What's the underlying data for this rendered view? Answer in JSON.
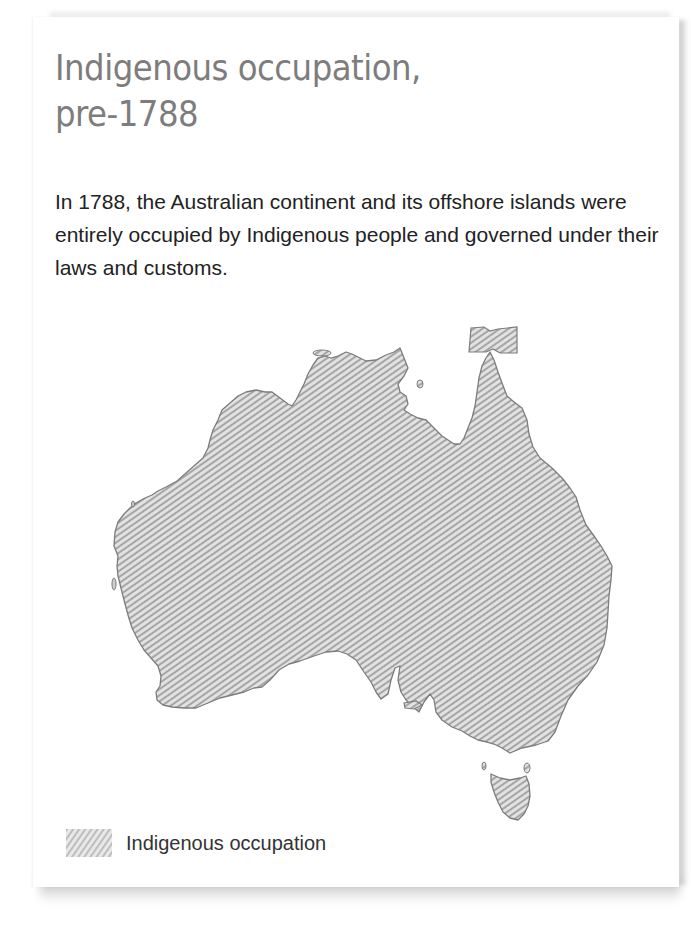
{
  "title": {
    "line1": "Indigenous occupation,",
    "line2": "pre-1788"
  },
  "description": "In 1788, the Australian continent and its offshore islands were entirely occupied by Indigenous people and governed under their laws and customs.",
  "map": {
    "region": "Australia",
    "fill_pattern": "diagonal-hatch",
    "hatch_line_color": "#9a9a9a",
    "hatch_bg_color": "#dedede",
    "outline_color": "#7a7a7a"
  },
  "legend": {
    "items": [
      {
        "label": "Indigenous occupation",
        "pattern": "diagonal-hatch"
      }
    ]
  },
  "colors": {
    "title": "#7d7d7d",
    "body": "#222222",
    "background": "#ffffff"
  }
}
